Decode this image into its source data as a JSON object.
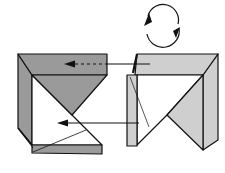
{
  "diagram": {
    "type": "origami-folding-step",
    "colors": {
      "background": "#ffffff",
      "outline": "#111111",
      "dark_gray": "#9a9a9a",
      "light_gray": "#cfcfcf",
      "white": "#ffffff"
    },
    "symbols": [
      {
        "name": "rotate-symbol",
        "meaning": "turn model around"
      },
      {
        "name": "arrow-dashed",
        "meaning": "fold behind / tuck under flap"
      },
      {
        "name": "arrow-solid",
        "meaning": "fold / tuck inside"
      }
    ]
  }
}
